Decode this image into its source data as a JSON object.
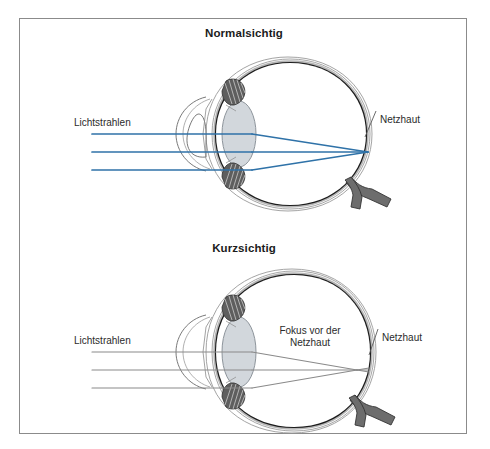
{
  "figure": {
    "title_top": "Normalsichtig",
    "title_bottom": "Kurzsichtig",
    "border_color": "#8b8b8b",
    "background": "#ffffff"
  },
  "panels": [
    {
      "id": "normal-sighted",
      "title": "Normalsichtig",
      "ray_color": "#2f72a8",
      "labels": {
        "light_rays": "Lichtstrahlen",
        "retina": "Netzhaut"
      },
      "rays": {
        "entry_y": [
          115,
          133,
          151
        ],
        "start_x": 72,
        "lens_x": 232,
        "focus_x": 348,
        "focus_y": 133
      },
      "focus_note": ""
    },
    {
      "id": "near-sighted",
      "title": "Kurzsichtig",
      "ray_color": "#8a8a8a",
      "labels": {
        "light_rays": "Lichtstrahlen",
        "focus_note_line1": "Fokus vor der",
        "focus_note_line2": "Netzhaut",
        "retina": "Netzhaut"
      },
      "rays": {
        "entry_y": [
          333,
          351,
          369
        ],
        "start_x": 72,
        "lens_x": 232,
        "focus_x": 337,
        "focus_y": 351,
        "retina_x": 349
      }
    }
  ],
  "anatomy": {
    "sclera_outer": "#ffffff",
    "sclera_stroke": "#2b2b2b",
    "choroid": "#b5b5b5",
    "retina_dark": "#1a1a1a",
    "lens_fill": "#d2d7dc",
    "ciliary_body": "#6f6f6f",
    "optic_nerve": "#5a5a5a",
    "outline": "#4a4a4a"
  }
}
